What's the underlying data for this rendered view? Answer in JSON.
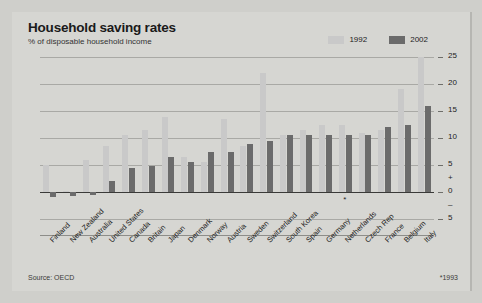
{
  "header": {
    "title": "Household saving rates",
    "subtitle": "% of disposable household income"
  },
  "legend": {
    "items": [
      {
        "label": "1992",
        "color": "#c9c9c9"
      },
      {
        "label": "2002",
        "color": "#6b6b6b"
      }
    ]
  },
  "footer": {
    "source": "Source: OECD",
    "footnote": "*1993"
  },
  "annotation": {
    "asterisk": "*"
  },
  "chart_data": {
    "type": "bar",
    "title": "Household saving rates",
    "subtitle": "% of disposable household income",
    "xlabel": "",
    "ylabel": "% of disposable household income",
    "ylim": [
      -5,
      25
    ],
    "yticks": [
      -5,
      0,
      5,
      10,
      15,
      20,
      25
    ],
    "ytick_labels": [
      "5",
      "0",
      "5",
      "10",
      "15",
      "20",
      "25"
    ],
    "sign_markers": {
      "plus": "+",
      "minus": "–"
    },
    "grid": true,
    "legend_position": "top-right",
    "categories": [
      "Finland",
      "New Zealand",
      "Australia",
      "United States",
      "Canada",
      "Britain",
      "Japan",
      "Denmark",
      "Norway",
      "Austria",
      "Sweden",
      "Switzerland",
      "South Korea",
      "Spain",
      "Germany",
      "Netherlands",
      "Czech Rep",
      "France",
      "Belgium",
      "Italy"
    ],
    "series": [
      {
        "name": "1992",
        "color": "#c9c9c9",
        "values": [
          5.0,
          0.2,
          6.0,
          8.5,
          10.5,
          11.5,
          13.8,
          6.5,
          5.5,
          13.5,
          8.5,
          22.0,
          10.5,
          11.5,
          12.5,
          12.5,
          11.0,
          11.5,
          19.0,
          25.0
        ]
      },
      {
        "name": "2002",
        "color": "#6b6b6b",
        "values": [
          -1.0,
          -0.8,
          -0.5,
          2.0,
          4.5,
          4.8,
          6.5,
          5.5,
          7.5,
          7.5,
          8.8,
          9.5,
          10.5,
          10.5,
          10.5,
          10.5,
          10.5,
          12.0,
          12.5,
          16.0
        ]
      }
    ]
  }
}
